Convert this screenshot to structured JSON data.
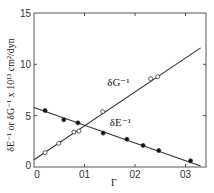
{
  "chart_data": {
    "type": "scatter",
    "title": "",
    "xlabel": "Γ",
    "ylabel": "δE⁻¹ or δG⁻¹ x 10¹³ cm²/dyn",
    "xlim": [
      0,
      0.33
    ],
    "ylim": [
      0,
      15
    ],
    "x_ticks": [
      0,
      0.1,
      0.2,
      0.3
    ],
    "x_tick_labels": [
      "0",
      "01",
      "02",
      "03"
    ],
    "y_ticks": [
      0,
      5,
      10,
      15
    ],
    "y_tick_labels": [
      "0",
      "5",
      "10",
      "15"
    ],
    "grid": false,
    "legend": "inline labels",
    "series": [
      {
        "name": "δG⁻¹",
        "marker": "open-circle",
        "points": [
          [
            0.022,
            1.4
          ],
          [
            0.049,
            2.3
          ],
          [
            0.079,
            3.4
          ],
          [
            0.089,
            3.5
          ],
          [
            0.136,
            5.4
          ],
          [
            0.231,
            8.6
          ],
          [
            0.245,
            8.8
          ]
        ],
        "fit_line": [
          [
            0,
            0.7
          ],
          [
            0.33,
            11.6
          ]
        ],
        "label_pos": [
          0.145,
          7.9
        ]
      },
      {
        "name": "δE⁻¹",
        "marker": "filled-circle",
        "points": [
          [
            0.022,
            5.5
          ],
          [
            0.059,
            4.6
          ],
          [
            0.087,
            4.3
          ],
          [
            0.137,
            3.3
          ],
          [
            0.184,
            2.7
          ],
          [
            0.216,
            2.1
          ],
          [
            0.247,
            1.6
          ],
          [
            0.31,
            0.6
          ]
        ],
        "fit_line": [
          [
            0,
            5.8
          ],
          [
            0.33,
            0.1
          ]
        ],
        "label_pos": [
          0.15,
          4.0
        ]
      }
    ]
  }
}
